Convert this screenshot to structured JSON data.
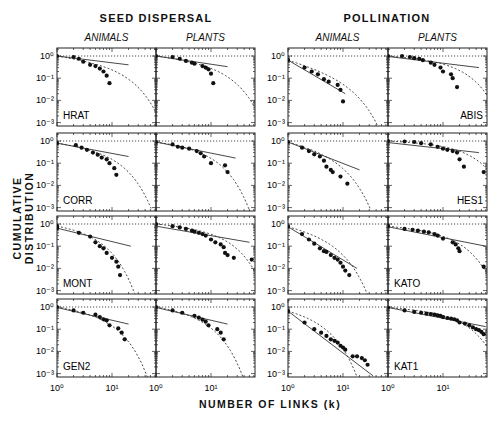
{
  "headers": {
    "left": "SEED DISPERSAL",
    "right": "POLLINATION",
    "sub_animals": "ANIMALS",
    "sub_plants": "PLANTS"
  },
  "axes": {
    "ylabel": "CUMULATIVE DISTRIBUTION",
    "xlabel": "NUMBER OF LINKS (k)",
    "yticks": [
      "10⁰",
      "10⁻¹",
      "10⁻²",
      "10⁻³"
    ],
    "xticks": [
      "10⁰",
      "10¹"
    ]
  },
  "chart_data": {
    "type": "scatter",
    "xlabel": "NUMBER OF LINKS (k)",
    "ylabel": "CUMULATIVE DISTRIBUTION",
    "xscale": "log",
    "yscale": "log",
    "xlim": [
      1,
      60
    ],
    "ylim": [
      0.001,
      1.5
    ],
    "column_groups": [
      "SEED DISPERSAL",
      "POLLINATION"
    ],
    "columns": [
      "ANIMALS",
      "PLANTS"
    ],
    "legend": {
      "points": "observed data",
      "solid": "power law fit",
      "dashed": "truncated power law fit",
      "dotted": "reference at P=1"
    },
    "panels": [
      {
        "network": "HRAT",
        "group": "SEED DISPERSAL",
        "type": "ANIMALS",
        "row": 0,
        "col": 0,
        "label_pos": "bl",
        "points": [
          [
            1,
            1
          ],
          [
            2,
            0.9
          ],
          [
            2.5,
            0.75
          ],
          [
            3,
            0.55
          ],
          [
            4,
            0.4
          ],
          [
            5,
            0.35
          ],
          [
            6,
            0.27
          ],
          [
            7,
            0.2
          ],
          [
            8,
            0.13
          ],
          [
            9,
            0.06
          ]
        ],
        "solid": [
          [
            1,
            1
          ],
          [
            20,
            0.4
          ]
        ],
        "dashed": {
          "a": -0.35,
          "kc": 14
        }
      },
      {
        "network": "HRAT",
        "group": "SEED DISPERSAL",
        "type": "PLANTS",
        "row": 0,
        "col": 1,
        "label_pos": "",
        "points": [
          [
            1,
            1
          ],
          [
            2,
            0.9
          ],
          [
            2.7,
            0.75
          ],
          [
            3.5,
            0.6
          ],
          [
            4.5,
            0.5
          ],
          [
            5,
            0.45
          ],
          [
            7,
            0.35
          ],
          [
            8,
            0.3
          ],
          [
            9,
            0.25
          ],
          [
            10,
            0.16
          ],
          [
            11,
            0.06
          ]
        ],
        "solid": [
          [
            1,
            1
          ],
          [
            20,
            0.33
          ]
        ],
        "dashed": {
          "a": -0.3,
          "kc": 15
        }
      },
      {
        "network": "ABIS",
        "group": "POLLINATION",
        "type": "ANIMALS",
        "row": 0,
        "col": 2,
        "label_pos": "",
        "points": [
          [
            1,
            0.65
          ],
          [
            2,
            0.3
          ],
          [
            2.7,
            0.2
          ],
          [
            3.5,
            0.15
          ],
          [
            4.5,
            0.09
          ],
          [
            5.5,
            0.07
          ],
          [
            8,
            0.05
          ],
          [
            9,
            0.03
          ],
          [
            10,
            0.009
          ]
        ],
        "solid": [
          [
            1,
            0.65
          ],
          [
            11,
            0.02
          ]
        ],
        "dashed": {
          "a": -0.7,
          "kc": 10
        }
      },
      {
        "network": "ABIS",
        "group": "POLLINATION",
        "type": "PLANTS",
        "row": 0,
        "col": 3,
        "label_pos": "br",
        "points": [
          [
            1,
            1
          ],
          [
            1.8,
            1
          ],
          [
            2.5,
            0.9
          ],
          [
            3,
            0.8
          ],
          [
            3.7,
            0.75
          ],
          [
            4.3,
            0.65
          ],
          [
            6,
            0.5
          ],
          [
            7,
            0.4
          ],
          [
            9,
            0.3
          ],
          [
            10,
            0.2
          ],
          [
            14,
            0.15
          ],
          [
            15,
            0.1
          ],
          [
            18,
            0.04
          ]
        ],
        "solid": [
          [
            1,
            0.95
          ],
          [
            45,
            0.3
          ]
        ],
        "dashed": {
          "a": -0.15,
          "kc": 18
        }
      },
      {
        "network": "CORR",
        "group": "SEED DISPERSAL",
        "type": "ANIMALS",
        "row": 1,
        "col": 0,
        "label_pos": "bl",
        "points": [
          [
            1,
            0.8
          ],
          [
            2.2,
            0.65
          ],
          [
            2.8,
            0.5
          ],
          [
            3.5,
            0.4
          ],
          [
            4.5,
            0.3
          ],
          [
            5.5,
            0.24
          ],
          [
            6.5,
            0.18
          ],
          [
            8,
            0.15
          ],
          [
            9,
            0.1
          ],
          [
            11,
            0.06
          ],
          [
            12,
            0.03
          ]
        ],
        "solid": [
          [
            1,
            0.8
          ],
          [
            20,
            0.2
          ]
        ],
        "dashed": {
          "a": -0.3,
          "kc": 9
        }
      },
      {
        "network": "CORR",
        "group": "SEED DISPERSAL",
        "type": "PLANTS",
        "row": 1,
        "col": 1,
        "label_pos": "",
        "points": [
          [
            1,
            0.9
          ],
          [
            2,
            0.7
          ],
          [
            2.5,
            0.55
          ],
          [
            3,
            0.5
          ],
          [
            4,
            0.45
          ],
          [
            5.5,
            0.35
          ],
          [
            6.5,
            0.28
          ],
          [
            7.5,
            0.2
          ],
          [
            10,
            0.1
          ],
          [
            18,
            0.08
          ],
          [
            20,
            0.04
          ]
        ],
        "solid": [
          [
            1,
            0.9
          ],
          [
            28,
            0.17
          ]
        ],
        "dashed": {
          "a": -0.25,
          "kc": 8
        }
      },
      {
        "network": "HES1",
        "group": "POLLINATION",
        "type": "ANIMALS",
        "row": 1,
        "col": 2,
        "label_pos": "",
        "points": [
          [
            1,
            0.9
          ],
          [
            1.8,
            0.5
          ],
          [
            2.4,
            0.35
          ],
          [
            3,
            0.25
          ],
          [
            3.8,
            0.2
          ],
          [
            4.5,
            0.13
          ],
          [
            5,
            0.07
          ],
          [
            6,
            0.05
          ],
          [
            6.5,
            0.04
          ],
          [
            9,
            0.025
          ],
          [
            12,
            0.012
          ]
        ],
        "solid": [
          [
            1,
            0.9
          ],
          [
            20,
            0.05
          ]
        ],
        "dashed": {
          "a": -0.55,
          "kc": 6
        }
      },
      {
        "network": "HES1",
        "group": "POLLINATION",
        "type": "PLANTS",
        "row": 1,
        "col": 3,
        "label_pos": "br",
        "points": [
          [
            1,
            1
          ],
          [
            2,
            0.95
          ],
          [
            3,
            0.9
          ],
          [
            4,
            0.8
          ],
          [
            6,
            0.7
          ],
          [
            8,
            0.55
          ],
          [
            10,
            0.45
          ],
          [
            12,
            0.4
          ],
          [
            15,
            0.35
          ],
          [
            18,
            0.3
          ],
          [
            20,
            0.15
          ],
          [
            24,
            0.07
          ],
          [
            55,
            0.04
          ]
        ],
        "solid": [
          [
            1,
            0.85
          ],
          [
            45,
            0.3
          ]
        ],
        "dashed": {
          "a": -0.1,
          "kc": 25
        }
      },
      {
        "network": "MONT",
        "group": "SEED DISPERSAL",
        "type": "ANIMALS",
        "row": 2,
        "col": 0,
        "label_pos": "bl",
        "points": [
          [
            1,
            0.8
          ],
          [
            1,
            0.65
          ],
          [
            2.5,
            0.4
          ],
          [
            4,
            0.27
          ],
          [
            5,
            0.15
          ],
          [
            6,
            0.1
          ],
          [
            7,
            0.08
          ],
          [
            8,
            0.05
          ],
          [
            10,
            0.03
          ],
          [
            12,
            0.02
          ],
          [
            13,
            0.012
          ],
          [
            14,
            0.005
          ]
        ],
        "solid": [
          [
            1,
            0.65
          ],
          [
            22,
            0.1
          ]
        ],
        "dashed": {
          "a": -0.25,
          "kc": 4
        }
      },
      {
        "network": "MONT",
        "group": "SEED DISPERSAL",
        "type": "PLANTS",
        "row": 2,
        "col": 1,
        "label_pos": "",
        "points": [
          [
            1,
            1
          ],
          [
            2,
            0.8
          ],
          [
            2.7,
            0.7
          ],
          [
            3.5,
            0.6
          ],
          [
            4.5,
            0.5
          ],
          [
            5,
            0.45
          ],
          [
            6,
            0.4
          ],
          [
            7,
            0.35
          ],
          [
            8,
            0.3
          ],
          [
            10,
            0.2
          ],
          [
            12,
            0.15
          ],
          [
            15,
            0.12
          ],
          [
            17,
            0.09
          ],
          [
            18,
            0.05
          ],
          [
            20,
            0.04
          ],
          [
            26,
            0.03
          ],
          [
            55,
            0.025
          ]
        ],
        "solid": [
          [
            1,
            0.8
          ],
          [
            50,
            0.15
          ]
        ],
        "dashed": {
          "a": -0.2,
          "kc": 15
        }
      },
      {
        "network": "KATO",
        "group": "POLLINATION",
        "type": "ANIMALS",
        "row": 2,
        "col": 2,
        "label_pos": "",
        "points": [
          [
            1,
            0.75
          ],
          [
            1.8,
            0.35
          ],
          [
            2.4,
            0.2
          ],
          [
            3,
            0.13
          ],
          [
            3.8,
            0.08
          ],
          [
            4.5,
            0.06
          ],
          [
            5,
            0.055
          ],
          [
            6,
            0.04
          ],
          [
            7,
            0.03
          ],
          [
            8,
            0.025
          ],
          [
            9,
            0.018
          ],
          [
            10,
            0.012
          ],
          [
            11,
            0.008
          ],
          [
            13,
            0.005
          ]
        ],
        "solid": [
          [
            1,
            0.75
          ],
          [
            18,
            0.01
          ]
        ],
        "dashed": {
          "a": -0.5,
          "kc": 5
        }
      },
      {
        "network": "KATO",
        "group": "POLLINATION",
        "type": "PLANTS",
        "row": 2,
        "col": 3,
        "label_pos": "bl",
        "points": [
          [
            1,
            0.8
          ],
          [
            2,
            0.6
          ],
          [
            2.8,
            0.55
          ],
          [
            3.5,
            0.5
          ],
          [
            4.5,
            0.45
          ],
          [
            5.5,
            0.42
          ],
          [
            7,
            0.35
          ],
          [
            8,
            0.3
          ],
          [
            10,
            0.22
          ],
          [
            15,
            0.15
          ],
          [
            17,
            0.12
          ],
          [
            19,
            0.08
          ],
          [
            20,
            0.06
          ],
          [
            55,
            0.012
          ]
        ],
        "solid": [
          [
            1,
            0.75
          ],
          [
            60,
            0.1
          ]
        ],
        "dashed": {
          "a": -0.2,
          "kc": 15
        }
      },
      {
        "network": "GEN2",
        "group": "SEED DISPERSAL",
        "type": "ANIMALS",
        "row": 3,
        "col": 0,
        "label_pos": "bl",
        "points": [
          [
            1,
            1
          ],
          [
            2,
            0.7
          ],
          [
            3,
            0.55
          ],
          [
            5,
            0.45
          ],
          [
            6,
            0.35
          ],
          [
            7,
            0.28
          ],
          [
            8,
            0.25
          ],
          [
            9,
            0.15
          ],
          [
            13,
            0.11
          ],
          [
            15,
            0.07
          ],
          [
            17,
            0.035
          ]
        ],
        "solid": [
          [
            1,
            0.95
          ],
          [
            20,
            0.17
          ]
        ],
        "dashed": {
          "a": -0.3,
          "kc": 7
        }
      },
      {
        "network": "GEN2",
        "group": "SEED DISPERSAL",
        "type": "PLANTS",
        "row": 3,
        "col": 1,
        "label_pos": "",
        "points": [
          [
            1,
            1
          ],
          [
            2,
            0.7
          ],
          [
            3,
            0.55
          ],
          [
            5,
            0.4
          ],
          [
            6,
            0.33
          ],
          [
            7,
            0.27
          ],
          [
            8,
            0.22
          ],
          [
            9,
            0.15
          ],
          [
            13,
            0.1
          ],
          [
            15,
            0.07
          ],
          [
            17,
            0.035
          ]
        ],
        "solid": [
          [
            1,
            0.95
          ],
          [
            20,
            0.17
          ]
        ],
        "dashed": {
          "a": -0.3,
          "kc": 6
        }
      },
      {
        "network": "KAT1",
        "group": "POLLINATION",
        "type": "ANIMALS",
        "row": 3,
        "col": 2,
        "label_pos": "",
        "points": [
          [
            1,
            0.65
          ],
          [
            2,
            0.2
          ],
          [
            3,
            0.1
          ],
          [
            4,
            0.07
          ],
          [
            5,
            0.05
          ],
          [
            6,
            0.035
          ],
          [
            7,
            0.03
          ],
          [
            8,
            0.025
          ],
          [
            9,
            0.018
          ],
          [
            10,
            0.015
          ],
          [
            11,
            0.012
          ],
          [
            15,
            0.006
          ],
          [
            18,
            0.006
          ],
          [
            22,
            0.005
          ],
          [
            25,
            0.004
          ],
          [
            28,
            0.0025
          ]
        ],
        "solid": [
          [
            1,
            0.65
          ],
          [
            35,
            0.0008
          ]
        ],
        "dashed": {
          "a": -0.4,
          "kc": 3
        }
      },
      {
        "network": "KAT1",
        "group": "POLLINATION",
        "type": "PLANTS",
        "row": 3,
        "col": 3,
        "label_pos": "bl",
        "points": [
          [
            1,
            0.95
          ],
          [
            2,
            0.7
          ],
          [
            3,
            0.6
          ],
          [
            4,
            0.55
          ],
          [
            5,
            0.5
          ],
          [
            6,
            0.48
          ],
          [
            7,
            0.45
          ],
          [
            8,
            0.42
          ],
          [
            9,
            0.4
          ],
          [
            10,
            0.35
          ],
          [
            12,
            0.32
          ],
          [
            14,
            0.3
          ],
          [
            16,
            0.28
          ],
          [
            18,
            0.25
          ],
          [
            20,
            0.2
          ],
          [
            25,
            0.18
          ],
          [
            30,
            0.15
          ],
          [
            35,
            0.12
          ],
          [
            40,
            0.1
          ],
          [
            45,
            0.09
          ],
          [
            50,
            0.075
          ],
          [
            55,
            0.06
          ]
        ],
        "solid": [
          [
            1,
            0.95
          ],
          [
            60,
            0.13
          ]
        ],
        "dashed": {
          "a": -0.15,
          "kc": 18
        }
      }
    ]
  }
}
